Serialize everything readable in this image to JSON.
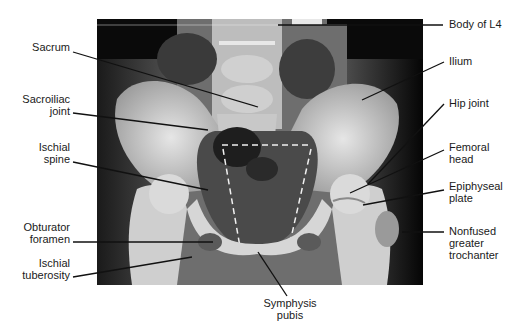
{
  "figure": {
    "labels_left": [
      {
        "id": "sacrum",
        "text": "Sacrum"
      },
      {
        "id": "sacroiliac-joint",
        "line1": "Sacroiliac",
        "line2": "joint"
      },
      {
        "id": "ischial-spine",
        "line1": "Ischial",
        "line2": "spine"
      },
      {
        "id": "obturator-foramen",
        "line1": "Obturator",
        "line2": "foramen"
      },
      {
        "id": "ischial-tuberosity",
        "line1": "Ischial",
        "line2": "tuberosity"
      }
    ],
    "labels_right": [
      {
        "id": "body-of-l4",
        "text": "Body of L4"
      },
      {
        "id": "ilium",
        "text": "Ilium"
      },
      {
        "id": "hip-joint",
        "text": "Hip joint"
      },
      {
        "id": "femoral-head",
        "line1": "Femoral",
        "line2": "head"
      },
      {
        "id": "epiphyseal-plate",
        "line1": "Epiphyseal",
        "line2": "plate"
      },
      {
        "id": "nonfused-greater-trochanter",
        "line1": "Nonfused",
        "line2": "greater",
        "line3": "trochanter"
      }
    ],
    "labels_bottom": [
      {
        "id": "symphysis-pubis",
        "line1": "Symphysis",
        "line2": "pubis"
      }
    ],
    "colors": {
      "background": "#ffffff",
      "xray_dark": "#0a0a0a",
      "bone": "#d8d8d8",
      "soft_tissue": "#5a5a5a",
      "leader_line": "#111111",
      "dashed_outline": "#f0f0f0",
      "text": "#1a1a1a"
    }
  }
}
